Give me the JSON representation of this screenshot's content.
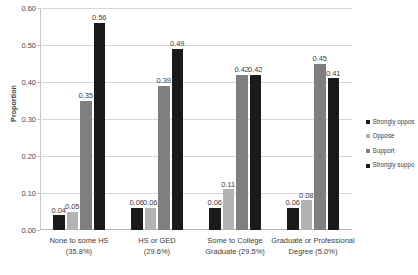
{
  "chart_data": {
    "type": "bar",
    "title": "",
    "subtitle": "",
    "xlabel": "",
    "ylabel": "Proportion",
    "ylim": [
      0.0,
      0.6
    ],
    "ytick_labels": [
      "0.60",
      "0.50",
      "0.40",
      "0.30",
      "0.20",
      "0.10",
      "0.00"
    ],
    "ytick_values": [
      0.6,
      0.5,
      0.4,
      0.3,
      0.2,
      0.1,
      0.0
    ],
    "grid": true,
    "legend_position": "right",
    "categories": [
      "None to some HS (35.8%)",
      "HS or GED (29.6%)",
      "Some to College Graduate (29.5%)",
      "Graduate or Professional Degree (5.0%)"
    ],
    "category_lines": [
      [
        "None to some HS",
        "(35.8%)"
      ],
      [
        "HS or GED",
        "(29.6%)"
      ],
      [
        "Some to College",
        "Graduate (29.5%)"
      ],
      [
        "Graduate or Professional",
        "Degree (5.0%)"
      ]
    ],
    "series": [
      {
        "name": "Strongly oppose",
        "legend_label": "Strongly oppos",
        "color": "#1a1a1a",
        "values": [
          0.04,
          0.06,
          0.06,
          0.06
        ],
        "labels": [
          "0.04",
          "0.06",
          "0.06",
          "0.06"
        ]
      },
      {
        "name": "Oppose",
        "legend_label": "Oppose",
        "color": "#b3b3b3",
        "values": [
          0.05,
          0.06,
          0.11,
          0.08
        ],
        "labels": [
          "0.05",
          "0.06",
          "0.11",
          "0.08"
        ]
      },
      {
        "name": "Support",
        "legend_label": "Support",
        "color": "#7f7f7f",
        "values": [
          0.35,
          0.39,
          0.42,
          0.45
        ],
        "labels": [
          "0.35",
          "0.39",
          "0.42",
          "0.45"
        ]
      },
      {
        "name": "Strongly support",
        "legend_label": "Strongly suppo",
        "color": "#1a1a1a",
        "values": [
          0.56,
          0.49,
          0.42,
          0.41
        ],
        "labels": [
          "0.56",
          "0.49",
          "0.42",
          "0.41"
        ]
      }
    ]
  }
}
